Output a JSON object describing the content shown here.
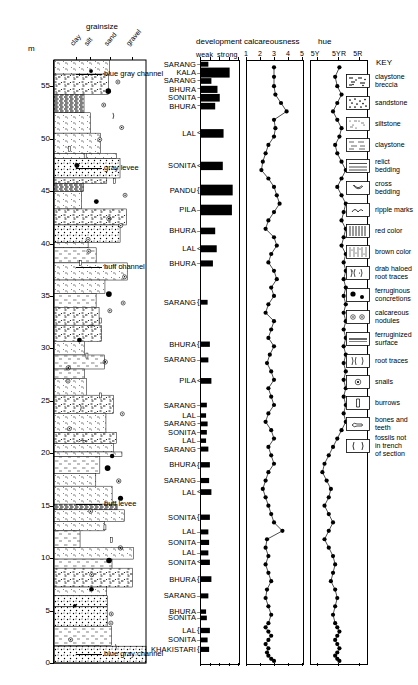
{
  "figure": {
    "axis_unit_label": "m",
    "grainsize_title": "grainsize",
    "grainsize_ticks": [
      "clay",
      "silt",
      "sand",
      "gravel"
    ],
    "scale_labels": [
      "0",
      "5",
      "10",
      "15",
      "20",
      "25",
      "30",
      "35",
      "40",
      "45",
      "50",
      "55"
    ],
    "scale_min": 0,
    "scale_max": 57.5
  },
  "panels": {
    "development": {
      "title": "development",
      "axis_left_label": "weak",
      "axis_right_label": "strong"
    },
    "calcareousness": {
      "title": "calcareousness",
      "ticks": [
        "1",
        "2",
        "3",
        "4",
        "5"
      ]
    },
    "hue": {
      "title": "hue",
      "ticks": [
        "5Y",
        "5YR",
        "5R"
      ]
    }
  },
  "annotations": [
    {
      "text": "blue gray channel",
      "level": 56.2
    },
    {
      "text": "gray levee",
      "level": 47.2
    },
    {
      "text": "buff channel",
      "level": 37.8
    },
    {
      "text": "buff levee",
      "level": 15.2
    },
    {
      "text": "blue gray channel",
      "level": 0.9
    }
  ],
  "soil_names": [
    {
      "label": "SARANG",
      "level": 57.1,
      "bracket": "line"
    },
    {
      "label": "KALA",
      "level": 56.3,
      "bracket": "line"
    },
    {
      "label": "SARANG",
      "level": 55.5,
      "bracket": "tilde"
    },
    {
      "label": "BHURA",
      "level": 54.7,
      "bracket": "tilde"
    },
    {
      "label": "SONITA",
      "level": 53.9,
      "bracket": "tilde"
    },
    {
      "label": "BHURA",
      "level": 53.1,
      "bracket": "tilde"
    },
    {
      "label": "LAL",
      "level": 50.5,
      "bracket": "angle"
    },
    {
      "label": "SONITA",
      "level": 47.4,
      "bracket": "angle"
    },
    {
      "label": "PANDU",
      "level": 45.1,
      "bracket": "brace"
    },
    {
      "label": "PILA",
      "level": 43.2,
      "bracket": "line"
    },
    {
      "label": "BHURA",
      "level": 41.2,
      "bracket": "line"
    },
    {
      "label": "LAL",
      "level": 39.5,
      "bracket": "angle"
    },
    {
      "label": "BHURA",
      "level": 38.1,
      "bracket": "line"
    },
    {
      "label": "SARANG",
      "level": 34.4,
      "bracket": "brace"
    },
    {
      "label": "BHURA",
      "level": 30.4,
      "bracket": "brace"
    },
    {
      "label": "SARANG",
      "level": 28.9,
      "bracket": "line"
    },
    {
      "label": "PILA",
      "level": 26.9,
      "bracket": "angle"
    },
    {
      "label": "SARANG",
      "level": 24.6,
      "bracket": "line"
    },
    {
      "label": "LAL",
      "level": 23.6,
      "bracket": "line"
    },
    {
      "label": "SARANG",
      "level": 22.8,
      "bracket": "tilde"
    },
    {
      "label": "SONITA",
      "level": 22.0,
      "bracket": "line"
    },
    {
      "label": "LAL",
      "level": 21.2,
      "bracket": "line"
    },
    {
      "label": "SARANG",
      "level": 20.4,
      "bracket": "tilde"
    },
    {
      "label": "BHURA",
      "level": 18.9,
      "bracket": "brace"
    },
    {
      "label": "SARANG",
      "level": 17.4,
      "bracket": "line"
    },
    {
      "label": "LAL",
      "level": 16.3,
      "bracket": "angle"
    },
    {
      "label": "SONITA",
      "level": 13.9,
      "bracket": "brace"
    },
    {
      "label": "LAL",
      "level": 12.5,
      "bracket": "line"
    },
    {
      "label": "SONITA",
      "level": 11.5,
      "bracket": "line"
    },
    {
      "label": "LAL",
      "level": 10.5,
      "bracket": "line"
    },
    {
      "label": "SONITA",
      "level": 9.6,
      "bracket": "angle"
    },
    {
      "label": "BHURA",
      "level": 8.0,
      "bracket": "brace"
    },
    {
      "label": "SARANG",
      "level": 6.4,
      "bracket": "line"
    },
    {
      "label": "BHURA",
      "level": 4.9,
      "bracket": "line"
    },
    {
      "label": "SONITA",
      "level": 4.3,
      "bracket": "line"
    },
    {
      "label": "LAL",
      "level": 3.1,
      "bracket": "brace"
    },
    {
      "label": "SONITA",
      "level": 2.2,
      "bracket": "line"
    },
    {
      "label": "KHAKISTARI",
      "level": 1.3,
      "bracket": "brace"
    }
  ],
  "key": {
    "title": "KEY",
    "items": [
      {
        "label": "claystone breccia",
        "pattern": "breccia"
      },
      {
        "label": "sandstone",
        "pattern": "sandstone"
      },
      {
        "label": "siltstone",
        "pattern": "siltstone"
      },
      {
        "label": "claystone",
        "pattern": "claystone"
      },
      {
        "label": "relict bedding",
        "pattern": "relict-bedding"
      },
      {
        "label": "cross bedding",
        "pattern": "cross-bedding"
      },
      {
        "label": "ripple marks",
        "pattern": "ripple-marks"
      },
      {
        "label": "red color",
        "pattern": "red-color"
      },
      {
        "label": "brown color",
        "pattern": "brown-color"
      },
      {
        "label": "drab haloed root traces",
        "pattern": "drab-haloed-root-traces"
      },
      {
        "label": "ferruginous concretions",
        "pattern": "ferruginous-concretions"
      },
      {
        "label": "calcareous nodules",
        "pattern": "calcareous-nodules"
      },
      {
        "label": "ferruginized surface",
        "pattern": "ferruginized-surface"
      },
      {
        "label": "root traces",
        "pattern": "root-traces"
      },
      {
        "label": "snails",
        "pattern": "snails"
      },
      {
        "label": "burrows",
        "pattern": "burrows"
      },
      {
        "label": "bones and teeth",
        "pattern": "bones-and-teeth"
      },
      {
        "label": "fossils not in trench of section",
        "pattern": "fossils-not-in-trench"
      }
    ]
  },
  "chart_data": [
    {
      "type": "bar",
      "title": "development",
      "xlabel": "",
      "ylabel": "m",
      "xlim": [
        0,
        1
      ],
      "ylim": [
        0,
        57.5
      ],
      "orientation": "horizontal",
      "axis_annotations": [
        "weak",
        "strong"
      ],
      "categories": [
        57.1,
        56.3,
        55.5,
        54.7,
        53.9,
        53.1,
        50.5,
        47.4,
        45.1,
        43.2,
        41.2,
        39.5,
        38.1,
        34.4,
        30.4,
        28.9,
        26.9,
        24.6,
        23.6,
        22.8,
        22.0,
        21.2,
        20.4,
        18.9,
        17.4,
        16.3,
        13.9,
        12.5,
        11.5,
        10.5,
        9.6,
        8.0,
        6.4,
        4.9,
        4.3,
        3.1,
        2.2,
        1.3
      ],
      "values": [
        0.22,
        0.78,
        0.3,
        0.46,
        0.52,
        0.4,
        0.62,
        0.6,
        0.86,
        0.84,
        0.4,
        0.44,
        0.34,
        0.2,
        0.26,
        0.22,
        0.3,
        0.18,
        0.16,
        0.2,
        0.18,
        0.16,
        0.22,
        0.26,
        0.24,
        0.3,
        0.26,
        0.22,
        0.24,
        0.22,
        0.26,
        0.3,
        0.22,
        0.16,
        0.18,
        0.26,
        0.2,
        0.24
      ]
    },
    {
      "type": "scatter",
      "title": "calcareousness",
      "xlabel": "",
      "ylabel": "m",
      "xlim": [
        1,
        5
      ],
      "ylim": [
        0,
        57.5
      ],
      "xticks": [
        1,
        2,
        3,
        4,
        5
      ],
      "x": [
        3.0,
        3.0,
        3.0,
        3.1,
        3.5,
        3.9,
        3.0,
        3.1,
        3.0,
        2.6,
        2.4,
        2.2,
        2.1,
        2.6,
        3.0,
        3.2,
        3.4,
        3.0,
        2.6,
        2.4,
        3.0,
        3.2,
        2.8,
        2.6,
        3.0,
        3.2,
        2.8,
        3.0,
        2.6,
        2.4,
        3.0,
        2.8,
        2.6,
        3.0,
        2.7,
        2.5,
        2.8,
        3.0,
        2.6,
        2.8,
        3.0,
        2.6,
        2.4,
        2.8,
        3.0,
        2.6,
        2.8,
        3.0,
        2.6,
        2.4,
        2.2,
        2.4,
        2.6,
        2.8,
        3.0,
        3.6,
        2.5,
        2.4,
        2.6,
        2.4,
        2.6,
        2.8,
        2.5,
        2.4,
        2.6,
        2.8,
        2.6,
        2.4,
        2.6,
        2.8,
        2.6,
        2.4,
        2.6,
        2.5,
        2.6,
        2.8,
        3.0
      ],
      "y": [
        56.8,
        55.9,
        55.0,
        54.2,
        53.4,
        52.6,
        51.8,
        51.0,
        50.2,
        49.4,
        48.6,
        47.8,
        47.0,
        46.2,
        45.4,
        44.6,
        43.8,
        43.0,
        42.2,
        41.4,
        40.6,
        39.8,
        39.0,
        38.2,
        37.4,
        36.6,
        35.8,
        35.0,
        34.2,
        33.4,
        32.6,
        31.8,
        31.0,
        30.2,
        29.4,
        28.6,
        27.8,
        27.0,
        26.2,
        25.4,
        24.6,
        23.8,
        23.0,
        22.2,
        21.4,
        20.6,
        19.8,
        19.0,
        18.2,
        17.4,
        16.6,
        15.8,
        15.0,
        14.2,
        13.4,
        12.6,
        11.8,
        11.0,
        10.2,
        9.4,
        8.6,
        7.8,
        7.0,
        6.2,
        5.4,
        4.6,
        3.8,
        3.4,
        3.0,
        2.6,
        2.2,
        1.8,
        1.4,
        1.0,
        0.7,
        0.4,
        0.2
      ]
    },
    {
      "type": "scatter",
      "title": "hue",
      "xlabel": "",
      "ylabel": "m",
      "xticks": [
        "5Y",
        "5YR",
        "5R"
      ],
      "ylim": [
        0,
        57.5
      ],
      "x": [
        2.1,
        1.9,
        2.0,
        2.2,
        2.0,
        1.8,
        2.0,
        2.2,
        2.1,
        1.9,
        2.0,
        2.2,
        2.4,
        2.2,
        2.0,
        2.2,
        2.4,
        2.3,
        2.2,
        2.4,
        2.3,
        2.2,
        2.4,
        2.3,
        2.4,
        2.3,
        2.4,
        2.3,
        2.4,
        2.3,
        2.4,
        2.3,
        2.4,
        2.3,
        2.4,
        2.3,
        2.4,
        2.3,
        2.4,
        2.3,
        2.4,
        2.3,
        2.4,
        2.2,
        2.0,
        1.8,
        1.6,
        1.4,
        1.3,
        1.5,
        1.7,
        1.6,
        1.4,
        1.6,
        1.8,
        1.6,
        1.4,
        1.6,
        1.8,
        1.9,
        1.8,
        1.7,
        1.9,
        2.0,
        1.9,
        1.8,
        1.9,
        2.0,
        2.1,
        2.0,
        1.9,
        2.0,
        2.1,
        2.0,
        1.9,
        2.0,
        2.1
      ],
      "y": [
        56.8,
        55.9,
        55.0,
        54.2,
        53.4,
        52.6,
        51.8,
        51.0,
        50.2,
        49.4,
        48.6,
        47.8,
        47.0,
        46.2,
        45.4,
        44.6,
        43.8,
        43.0,
        42.2,
        41.4,
        40.6,
        39.8,
        39.0,
        38.2,
        37.4,
        36.6,
        35.8,
        35.0,
        34.2,
        33.4,
        32.6,
        31.8,
        31.0,
        30.2,
        29.4,
        28.6,
        27.8,
        27.0,
        26.2,
        25.4,
        24.6,
        23.8,
        23.0,
        22.2,
        21.4,
        20.6,
        19.8,
        19.0,
        18.2,
        17.4,
        16.6,
        15.8,
        15.0,
        14.2,
        13.4,
        12.6,
        11.8,
        11.0,
        10.2,
        9.4,
        8.6,
        7.8,
        7.0,
        6.2,
        5.4,
        4.6,
        3.8,
        3.4,
        3.0,
        2.6,
        2.2,
        1.8,
        1.4,
        1.0,
        0.7,
        0.4,
        0.2
      ]
    }
  ]
}
